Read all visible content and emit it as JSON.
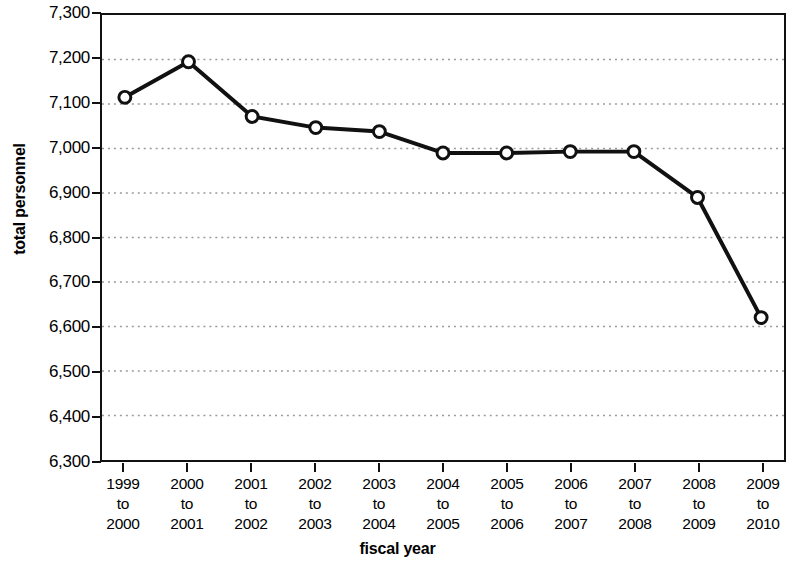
{
  "chart_data": {
    "type": "line",
    "title": "",
    "xlabel": "fiscal year",
    "ylabel": "total personnel",
    "categories": [
      "1999 to 2000",
      "2000 to 2001",
      "2001 to 2002",
      "2002 to 2003",
      "2003 to 2004",
      "2004 to 2005",
      "2005 to 2006",
      "2006 to 2007",
      "2007 to 2008",
      "2008 to 2009",
      "2009 to 2010"
    ],
    "category_lines": [
      [
        "1999",
        "to",
        "2000"
      ],
      [
        "2000",
        "to",
        "2001"
      ],
      [
        "2001",
        "to",
        "2002"
      ],
      [
        "2002",
        "to",
        "2003"
      ],
      [
        "2003",
        "to",
        "2004"
      ],
      [
        "2004",
        "to",
        "2005"
      ],
      [
        "2005",
        "to",
        "2006"
      ],
      [
        "2006",
        "to",
        "2007"
      ],
      [
        "2007",
        "to",
        "2008"
      ],
      [
        "2008",
        "to",
        "2009"
      ],
      [
        "2009",
        "to",
        "2010"
      ]
    ],
    "values": [
      7115,
      7195,
      7072,
      7047,
      7038,
      6990,
      6990,
      6993,
      6993,
      6890,
      6620
    ],
    "ylim": [
      6300,
      7300
    ],
    "ytick_values": [
      7300,
      7200,
      7100,
      7000,
      6900,
      6800,
      6700,
      6600,
      6500,
      6400,
      6300
    ],
    "ytick_labels": [
      "7,300",
      "7,200",
      "7,100",
      "7,000",
      "6,900",
      "6,800",
      "6,700",
      "6,600",
      "6,500",
      "6,400",
      "6,300"
    ],
    "grid": true,
    "grid_style": "dotted",
    "legend": "none",
    "marker": "open-circle",
    "line_color": "#111111",
    "marker_fill": "#ffffff",
    "marker_stroke": "#111111",
    "grid_color": "#9a9a9a",
    "axis_color": "#111111"
  }
}
